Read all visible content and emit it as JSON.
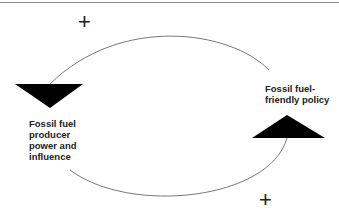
{
  "diagram": {
    "type": "causal-loop",
    "nodes": [
      {
        "id": "producer",
        "label": "Fossil fuel producer power and influence",
        "shape": "downward-triangle"
      },
      {
        "id": "policy",
        "label": "Fossil fuel-friendly policy",
        "shape": "upward-triangle"
      }
    ],
    "links": [
      {
        "from": "policy",
        "to": "producer",
        "polarity": "+",
        "path": "top-arc"
      },
      {
        "from": "producer",
        "to": "policy",
        "polarity": "+",
        "path": "bottom-arc"
      }
    ],
    "labels": {
      "producer": "Fossil fuel producer power and influence",
      "policy": "Fossil fuel-friendly policy",
      "top_polarity": "+",
      "bottom_polarity": "+"
    },
    "colors": {
      "shape_fill": "#000000",
      "line": "#555555",
      "text": "#222222",
      "rule": "#8a8a8a"
    }
  }
}
